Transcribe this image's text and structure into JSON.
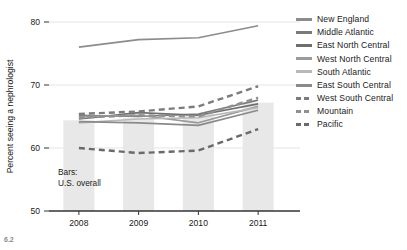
{
  "chart_data": {
    "type": "line",
    "title": "",
    "subtitle": "",
    "xlabel": "",
    "ylabel": "Percent seeing a nephrologist",
    "x": [
      "2008",
      "2009",
      "2010",
      "2011"
    ],
    "categories": [
      "2008",
      "2009",
      "2010",
      "2011"
    ],
    "xtick_labels": [
      "2008",
      "2009",
      "2010",
      "2011"
    ],
    "ytick_labels": [
      "50",
      "60",
      "70",
      "80"
    ],
    "ytick_values": [
      50,
      60,
      70,
      80
    ],
    "ylim": [
      50,
      80
    ],
    "xlim": [
      2007.6,
      2011.6
    ],
    "grid": "horizontal-light",
    "legend_position": "right",
    "bars": {
      "name": "U.S. overall",
      "annotation": [
        "Bars:",
        "U.S. overall"
      ],
      "color": "#e8e8e8",
      "values": [
        64.4,
        64.8,
        65.4,
        67.2
      ]
    },
    "series": [
      {
        "name": "New England",
        "values": [
          76.0,
          77.2,
          77.5,
          79.4
        ],
        "color": "#8c8c8c",
        "dash": "solid"
      },
      {
        "name": "Middle Atlantic",
        "values": [
          65.2,
          65.0,
          65.4,
          67.6
        ],
        "color": "#7a7a7a",
        "dash": "solid"
      },
      {
        "name": "East North Central",
        "values": [
          64.6,
          65.6,
          65.2,
          67.0
        ],
        "color": "#6e6e6e",
        "dash": "solid"
      },
      {
        "name": "West North Central",
        "values": [
          65.0,
          65.2,
          64.0,
          66.6
        ],
        "color": "#9a9a9a",
        "dash": "solid"
      },
      {
        "name": "South Atlantic",
        "values": [
          64.0,
          64.6,
          64.8,
          66.4
        ],
        "color": "#b8b8b8",
        "dash": "solid"
      },
      {
        "name": "East South Central",
        "values": [
          64.2,
          64.0,
          63.6,
          66.0
        ],
        "color": "#8a8a8a",
        "dash": "solid"
      },
      {
        "name": "West South Central",
        "values": [
          65.4,
          65.8,
          66.6,
          69.8
        ],
        "color": "#7c7c7c",
        "dash": "dashed"
      },
      {
        "name": "Mountain",
        "values": [
          64.8,
          65.2,
          65.0,
          68.0
        ],
        "color": "#909090",
        "dash": "dashed"
      },
      {
        "name": "Pacific",
        "values": [
          60.0,
          59.2,
          59.6,
          63.0
        ],
        "color": "#6a6a6a",
        "dash": "dashed"
      }
    ]
  },
  "axes": {
    "y_title": "Percent seeing a nephrologist",
    "y_ticks": [
      "80",
      "70",
      "60",
      "50"
    ],
    "x_ticks": [
      "2008",
      "2009",
      "2010",
      "2011"
    ]
  },
  "legend": {
    "items": [
      {
        "label": "New England",
        "color": "#8c8c8c",
        "dash": "solid"
      },
      {
        "label": "Middle Atlantic",
        "color": "#7a7a7a",
        "dash": "solid"
      },
      {
        "label": "East North Central",
        "color": "#6e6e6e",
        "dash": "solid"
      },
      {
        "label": "West North Central",
        "color": "#9a9a9a",
        "dash": "solid"
      },
      {
        "label": "South Atlantic",
        "color": "#b8b8b8",
        "dash": "solid"
      },
      {
        "label": "East South Central",
        "color": "#8a8a8a",
        "dash": "solid"
      },
      {
        "label": "West South Central",
        "color": "#7c7c7c",
        "dash": "dashed"
      },
      {
        "label": "Mountain",
        "color": "#909090",
        "dash": "dashed"
      },
      {
        "label": "Pacific",
        "color": "#6a6a6a",
        "dash": "dashed"
      }
    ]
  },
  "annotation": {
    "line1": "Bars:",
    "line2": "U.S. overall"
  },
  "caption": {
    "text": "6.2"
  },
  "colors": {
    "bar_fill": "#e8e8e8",
    "axis": "#333333",
    "grid": "#d9d9d9",
    "text": "#1a1a1a"
  }
}
